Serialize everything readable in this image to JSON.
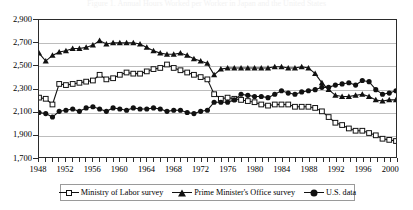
{
  "title": "Figure 1. Annual Hours Worked per Worker in Japan and the United States",
  "axes": {
    "y_ticks": [
      "2,900",
      "2,700",
      "2,500",
      "2,300",
      "2,100",
      "1,900",
      "1,700"
    ],
    "y_min": 1700,
    "y_max": 2900,
    "y_step": 200,
    "x_min": 1948,
    "x_max": 2001,
    "x_labels": [
      "1948",
      "1952",
      "1956",
      "1960",
      "1964",
      "1968",
      "1972",
      "1976",
      "1980",
      "1984",
      "1988",
      "1992",
      "1996",
      "2000"
    ],
    "x_label_step": 4,
    "x_tick_step": 1
  },
  "legend": {
    "items": [
      {
        "label": "Ministry of Labor survey",
        "marker": "open-square"
      },
      {
        "label": "Prime Minister's Office survey",
        "marker": "filled-triangle"
      },
      {
        "label": "U.S. data",
        "marker": "filled-circle"
      }
    ]
  },
  "colors": {
    "ink": "#111111",
    "frame": "#2b2b2b",
    "grid": "#bdbdbd",
    "background": "#ffffff"
  },
  "chart_data": {
    "type": "line",
    "title": "Figure 1. Annual Hours Worked per Worker in Japan and the United States",
    "xlabel": "",
    "ylabel": "",
    "xlim": [
      1948,
      2001
    ],
    "ylim": [
      1700,
      2900
    ],
    "grid": true,
    "legend_position": "bottom",
    "x": [
      1948,
      1949,
      1950,
      1951,
      1952,
      1953,
      1954,
      1955,
      1956,
      1957,
      1958,
      1959,
      1960,
      1961,
      1962,
      1963,
      1964,
      1965,
      1966,
      1967,
      1968,
      1969,
      1970,
      1971,
      1972,
      1973,
      1974,
      1975,
      1976,
      1977,
      1978,
      1979,
      1980,
      1981,
      1982,
      1983,
      1984,
      1985,
      1986,
      1987,
      1988,
      1989,
      1990,
      1991,
      1992,
      1993,
      1994,
      1995,
      1996,
      1997,
      1998,
      1999,
      2000,
      2001
    ],
    "series": [
      {
        "name": "Ministry of Labor survey",
        "marker": "open-square",
        "values": [
          2220,
          2210,
          2160,
          2340,
          2330,
          2340,
          2350,
          2360,
          2370,
          2420,
          2380,
          2390,
          2420,
          2440,
          2430,
          2430,
          2450,
          2470,
          2480,
          2510,
          2480,
          2460,
          2440,
          2420,
          2400,
          2380,
          2250,
          2210,
          2220,
          2210,
          2200,
          2190,
          2180,
          2160,
          2150,
          2160,
          2160,
          2160,
          2140,
          2140,
          2140,
          2130,
          2100,
          2050,
          2000,
          1980,
          1950,
          1930,
          1930,
          1910,
          1890,
          1860,
          1850,
          1840
        ]
      },
      {
        "name": "Prime Minister's Office survey",
        "marker": "filled-triangle",
        "values": [
          2610,
          2540,
          2590,
          2620,
          2630,
          2650,
          2650,
          2660,
          2680,
          2720,
          2690,
          2700,
          2700,
          2700,
          2700,
          2690,
          2660,
          2630,
          2610,
          2600,
          2600,
          2610,
          2590,
          2560,
          2540,
          2520,
          2420,
          2470,
          2480,
          2480,
          2480,
          2480,
          2480,
          2480,
          2480,
          2490,
          2490,
          2480,
          2480,
          2490,
          2480,
          2430,
          2350,
          2290,
          2240,
          2230,
          2230,
          2240,
          2250,
          2230,
          2200,
          2190,
          2200,
          2200
        ]
      },
      {
        "name": "U.S. data",
        "marker": "filled-circle",
        "values": [
          2090,
          2080,
          2050,
          2100,
          2110,
          2120,
          2100,
          2130,
          2140,
          2120,
          2100,
          2130,
          2120,
          2110,
          2130,
          2120,
          2120,
          2130,
          2120,
          2100,
          2110,
          2110,
          2090,
          2080,
          2100,
          2110,
          2180,
          2180,
          2180,
          2200,
          2250,
          2240,
          2230,
          2230,
          2220,
          2250,
          2280,
          2260,
          2250,
          2270,
          2280,
          2290,
          2310,
          2310,
          2330,
          2340,
          2350,
          2330,
          2370,
          2360,
          2290,
          2250,
          2260,
          2280
        ]
      }
    ]
  }
}
